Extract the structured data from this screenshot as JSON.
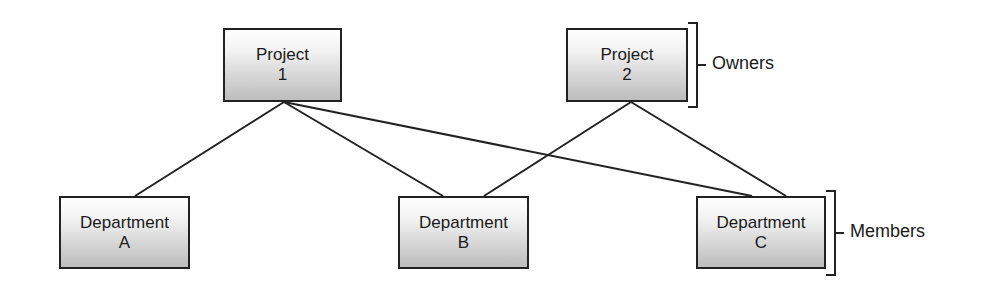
{
  "owners": [
    {
      "id": "project-1",
      "line1": "Project",
      "line2": "1",
      "x": 223,
      "y": 28,
      "w": 119,
      "h": 74
    },
    {
      "id": "project-2",
      "line1": "Project",
      "line2": "2",
      "x": 566,
      "y": 28,
      "w": 122,
      "h": 74
    }
  ],
  "members": [
    {
      "id": "department-a",
      "line1": "Department",
      "line2": "A",
      "x": 59,
      "y": 196,
      "w": 131,
      "h": 73
    },
    {
      "id": "department-b",
      "line1": "Department",
      "line2": "B",
      "x": 398,
      "y": 196,
      "w": 131,
      "h": 73
    },
    {
      "id": "department-c",
      "line1": "Department",
      "line2": "C",
      "x": 696,
      "y": 196,
      "w": 130,
      "h": 73
    }
  ],
  "links": [
    {
      "from": "project-1",
      "to": "department-a",
      "x1": 284,
      "y1": 102,
      "x2": 135,
      "y2": 196
    },
    {
      "from": "project-1",
      "to": "department-b",
      "x1": 284,
      "y1": 102,
      "x2": 443,
      "y2": 196
    },
    {
      "from": "project-1",
      "to": "department-c",
      "x1": 284,
      "y1": 102,
      "x2": 752,
      "y2": 196
    },
    {
      "from": "project-2",
      "to": "department-b",
      "x1": 631,
      "y1": 102,
      "x2": 484,
      "y2": 196
    },
    {
      "from": "project-2",
      "to": "department-c",
      "x1": 631,
      "y1": 102,
      "x2": 786,
      "y2": 196
    }
  ],
  "groups": {
    "owners_label": "Owners",
    "members_label": "Members"
  },
  "colors": {
    "stroke": "#222222"
  }
}
